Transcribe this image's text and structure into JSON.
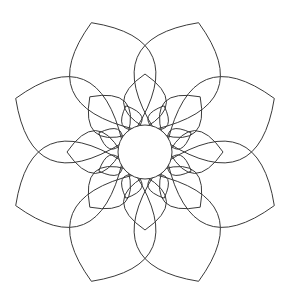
{
  "figure": {
    "type": "rosette-line-drawing",
    "background": "#ffffff",
    "stroke_color": "#3a3a3a",
    "center": [
      145,
      152
    ],
    "center_circle_radius": 27,
    "symmetry": 8,
    "layers": [
      {
        "name": "outer-petals",
        "count": 8,
        "tip_radius": 140,
        "angle_offset_deg": 22.5,
        "width_factor": 0.62
      },
      {
        "name": "middle-petals",
        "count": 8,
        "tip_radius": 78,
        "angle_offset_deg": 0,
        "width_factor": 0.55
      },
      {
        "name": "inner-petals",
        "count": 8,
        "tip_radius": 50,
        "angle_offset_deg": 22.5,
        "width_factor": 0.42
      }
    ]
  }
}
